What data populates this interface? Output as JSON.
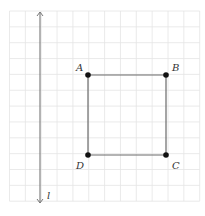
{
  "diagram": {
    "grid": {
      "x0": 9.5,
      "y0": 11,
      "cell": 15.85,
      "cols": 12,
      "rows": 12,
      "color": "#e4e4e4"
    },
    "line_l": {
      "label": "l",
      "x": 40,
      "y_top": 12,
      "y_bottom": 203,
      "label_x": 47,
      "label_y": 199,
      "color": "#777777"
    },
    "square": {
      "edge_color": "#6a6a6a",
      "point_color": "#111111",
      "vertices": [
        {
          "name": "A",
          "x": 88,
          "y": 75,
          "label_x": 76,
          "label_y": 71
        },
        {
          "name": "B",
          "x": 166,
          "y": 75,
          "label_x": 172,
          "label_y": 71
        },
        {
          "name": "C",
          "x": 166,
          "y": 155,
          "label_x": 172,
          "label_y": 169
        },
        {
          "name": "D",
          "x": 88,
          "y": 155,
          "label_x": 76,
          "label_y": 169
        }
      ]
    }
  }
}
